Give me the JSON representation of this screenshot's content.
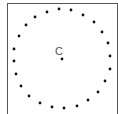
{
  "diagram": {
    "center_label": "C",
    "center": {
      "x": 62,
      "y": 59
    },
    "dot_color": "#111111",
    "border_color": "#555555",
    "dots": [
      [
        47,
        12
      ],
      [
        59,
        9
      ],
      [
        71,
        10
      ],
      [
        83,
        15
      ],
      [
        94,
        22
      ],
      [
        102,
        32
      ],
      [
        108,
        43
      ],
      [
        110,
        56
      ],
      [
        110,
        69
      ],
      [
        105,
        81
      ],
      [
        98,
        92
      ],
      [
        88,
        100
      ],
      [
        77,
        106
      ],
      [
        64,
        108
      ],
      [
        52,
        107
      ],
      [
        40,
        103
      ],
      [
        29,
        96
      ],
      [
        21,
        86
      ],
      [
        16,
        74
      ],
      [
        14,
        61
      ],
      [
        14,
        49
      ],
      [
        19,
        36
      ],
      [
        26,
        25
      ],
      [
        35,
        17
      ]
    ]
  }
}
